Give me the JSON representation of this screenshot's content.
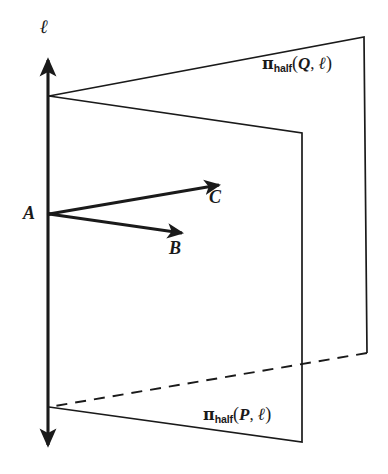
{
  "figure": {
    "type": "geometry-diagram",
    "background_color": "#ffffff",
    "stroke_color": "#1a1a1a"
  },
  "line": {
    "name": "line-ell",
    "label": "ℓ",
    "orientation": "vertical",
    "double_headed": true,
    "x": 48,
    "y_top_arrow_tip": 53,
    "y_bottom_arrow_tip": 452,
    "label_pos": {
      "x": 40,
      "y": 24
    }
  },
  "points": [
    {
      "name": "point-A",
      "label": "A",
      "x": 49,
      "y": 214,
      "label_pos": {
        "x": 24,
        "y": 205
      }
    }
  ],
  "vectors": [
    {
      "name": "vector-B",
      "label": "B",
      "from": {
        "x": 49,
        "y": 214
      },
      "to": {
        "x": 186,
        "y": 234
      },
      "label_pos": {
        "x": 170,
        "y": 241
      }
    },
    {
      "name": "vector-C",
      "label": "C",
      "from": {
        "x": 49,
        "y": 214
      },
      "to": {
        "x": 223,
        "y": 184
      },
      "label_pos": {
        "x": 209,
        "y": 188
      }
    }
  ],
  "planes": [
    {
      "name": "half-plane-Q",
      "label_parts": {
        "pi": "π",
        "subscript": "half",
        "open_paren": "(",
        "arg": "Q",
        "comma": ", ",
        "line": "ℓ",
        "close_paren": ")"
      },
      "label_text": "πhalf(Q, ℓ)",
      "label_pos": {
        "x": 262,
        "y": 56
      },
      "vertices": [
        {
          "x": 49,
          "y": 96
        },
        {
          "x": 364,
          "y": 37
        },
        {
          "x": 367,
          "y": 353
        },
        {
          "x": 49,
          "y": 407
        }
      ],
      "hidden_edge": "bottom",
      "hidden_edge_style": "dashed"
    },
    {
      "name": "half-plane-P",
      "label_parts": {
        "pi": "π",
        "subscript": "half",
        "open_paren": "(",
        "arg": "P",
        "comma": ", ",
        "line": "ℓ",
        "close_paren": ")"
      },
      "label_text": "πhalf(P, ℓ)",
      "label_pos": {
        "x": 203,
        "y": 407
      },
      "vertices": [
        {
          "x": 49,
          "y": 96
        },
        {
          "x": 302,
          "y": 133
        },
        {
          "x": 302,
          "y": 442
        },
        {
          "x": 49,
          "y": 407
        }
      ],
      "hidden_edge": "none",
      "hidden_edge_style": "solid"
    }
  ]
}
